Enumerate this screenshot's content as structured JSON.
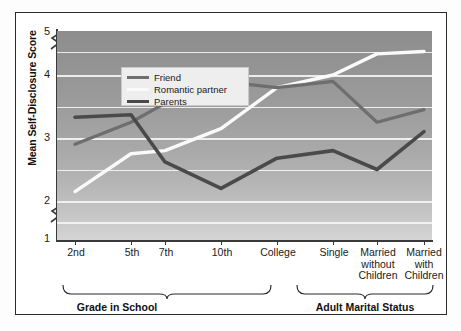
{
  "chart_data": {
    "type": "line",
    "title": "",
    "xlabel": "",
    "ylabel": "Mean Self-Disclosure Score",
    "ylim": [
      1,
      5
    ],
    "yticks": [
      1,
      2,
      3,
      4,
      5
    ],
    "ytick_labels": [
      "1",
      "2",
      "3",
      "4",
      "5"
    ],
    "gridlines": [
      1.5,
      2,
      2.5,
      3,
      3.5,
      4,
      4.5
    ],
    "grid": true,
    "axis_breaks": [
      "between 1 and 2",
      "between 4.5 and 5"
    ],
    "legend_position": "top-left inside plot",
    "categories": [
      "2nd",
      "5th",
      "7th",
      "10th",
      "College",
      "Single",
      "Married without Children",
      "Married with Children"
    ],
    "series": [
      {
        "name": "Friend",
        "color": "#6e6e6e",
        "values": [
          2.9,
          3.25,
          3.55,
          3.9,
          3.8,
          3.9,
          3.25,
          3.45
        ]
      },
      {
        "name": "Romantic partner",
        "color": "#fafafa",
        "values": [
          2.15,
          2.75,
          2.8,
          3.15,
          3.8,
          4.0,
          4.45,
          4.5
        ]
      },
      {
        "name": "Parents",
        "color": "#4a4a4a",
        "values": [
          3.33,
          3.37,
          2.62,
          2.2,
          2.68,
          2.8,
          2.5,
          3.1
        ]
      }
    ],
    "x_groups": [
      {
        "label": "Grade in School",
        "categories": [
          "2nd",
          "5th",
          "7th",
          "10th",
          "College"
        ]
      },
      {
        "label": "Adult Marital Status",
        "categories": [
          "Single",
          "Married without Children",
          "Married with Children"
        ]
      }
    ]
  },
  "legend": {
    "items": [
      {
        "label": "Friend",
        "color": "#6e6e6e"
      },
      {
        "label": "Romantic partner",
        "color": "#fafafa"
      },
      {
        "label": "Parents",
        "color": "#4a4a4a"
      }
    ]
  },
  "yaxis": {
    "title": "Mean Self-Disclosure Score",
    "ticks": [
      "5",
      "4",
      "3",
      "2",
      "1"
    ]
  },
  "xaxis": {
    "labels": [
      {
        "line1": "2nd",
        "line2": "",
        "line3": ""
      },
      {
        "line1": "5th",
        "line2": "",
        "line3": ""
      },
      {
        "line1": "7th",
        "line2": "",
        "line3": ""
      },
      {
        "line1": "10th",
        "line2": "",
        "line3": ""
      },
      {
        "line1": "College",
        "line2": "",
        "line3": ""
      },
      {
        "line1": "Single",
        "line2": "",
        "line3": ""
      },
      {
        "line1": "Married",
        "line2": "without",
        "line3": "Children"
      },
      {
        "line1": "Married",
        "line2": "with",
        "line3": "Children"
      }
    ]
  },
  "groups": {
    "left_label": "Grade in School",
    "right_label": "Adult Marital Status"
  },
  "colors": {
    "frame": "#2b2b2b",
    "axis": "#3a3a3a",
    "gridline": "#f4f4f4",
    "plot_top": "#8d8d8d",
    "plot_bottom": "#d4d4d4",
    "legend_bg": "#eeeeee"
  }
}
